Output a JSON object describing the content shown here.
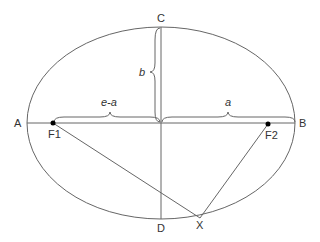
{
  "diagram": {
    "points": {
      "A": "A",
      "B": "B",
      "C": "C",
      "D": "D",
      "F1": "F1",
      "F2": "F2",
      "X": "X"
    },
    "brace_labels": {
      "b": "b",
      "e_minus_a": "e-a",
      "a": "a"
    },
    "colors": {
      "stroke": "#555555",
      "text": "#333333",
      "focus": "#000000"
    }
  }
}
